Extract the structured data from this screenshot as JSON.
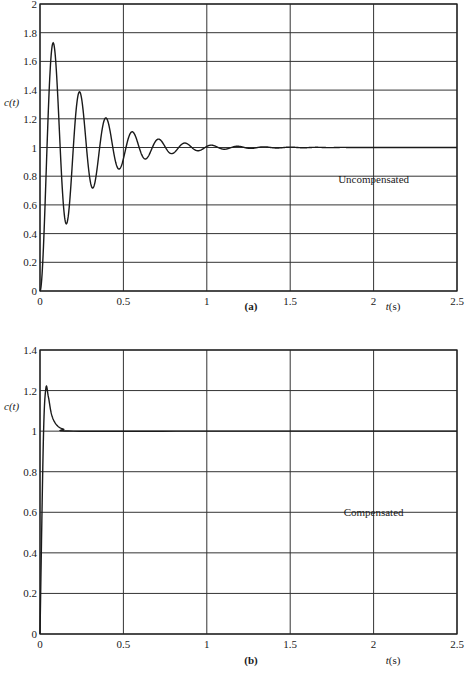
{
  "colors": {
    "line": "#1a1a1a",
    "grid": "#333333",
    "background": "#ffffff"
  },
  "chart_data": [
    {
      "type": "line",
      "panel": "(a)",
      "caption": "(a)",
      "title": "",
      "xlabel": "t(s)",
      "ylabel": "c(t)",
      "xlim": [
        0,
        2.5
      ],
      "ylim": [
        0,
        2
      ],
      "grid": true,
      "xticks": [
        "0",
        "0.5",
        "1",
        "1.5",
        "2",
        "2.5"
      ],
      "yticks": [
        "0",
        "0.2",
        "0.4",
        "0.6",
        "0.8",
        "1",
        "1.2",
        "1.4",
        "1.6",
        "1.8",
        "2"
      ],
      "annotation": {
        "text": "Uncompensated",
        "x": 2.0,
        "y": 0.75
      },
      "series": [
        {
          "name": "Uncompensated",
          "model": {
            "zeta": 0.1,
            "wn": 40,
            "final_value": 1
          },
          "key_points": [
            {
              "t": 0.0,
              "c": 0.0
            },
            {
              "t": 0.08,
              "c": 1.8
            },
            {
              "t": 0.16,
              "c": 0.34
            },
            {
              "t": 0.24,
              "c": 1.53
            },
            {
              "t": 0.32,
              "c": 0.55
            },
            {
              "t": 0.39,
              "c": 1.35
            },
            {
              "t": 0.47,
              "c": 0.69
            },
            {
              "t": 0.55,
              "c": 1.24
            },
            {
              "t": 0.63,
              "c": 0.79
            },
            {
              "t": 0.71,
              "c": 1.16
            },
            {
              "t": 0.79,
              "c": 0.86
            },
            {
              "t": 0.87,
              "c": 1.1
            },
            {
              "t": 0.95,
              "c": 0.91
            },
            {
              "t": 1.03,
              "c": 1.07
            },
            {
              "t": 1.11,
              "c": 0.95
            },
            {
              "t": 1.5,
              "c": 1.01
            },
            {
              "t": 2.0,
              "c": 1.0
            },
            {
              "t": 2.5,
              "c": 1.0
            }
          ]
        }
      ]
    },
    {
      "type": "line",
      "panel": "(b)",
      "caption": "(b)",
      "title": "",
      "xlabel": "t(s)",
      "ylabel": "c(t)",
      "xlim": [
        0,
        2.5
      ],
      "ylim": [
        0,
        1.4
      ],
      "grid": true,
      "xticks": [
        "0",
        "0.5",
        "1",
        "1.5",
        "2",
        "2.5"
      ],
      "yticks": [
        "0",
        "0.2",
        "0.4",
        "0.6",
        "0.8",
        "1",
        "1.2",
        "1.4"
      ],
      "annotation": {
        "text": "Compensated",
        "x": 2.0,
        "y": 0.58
      },
      "series": [
        {
          "name": "Compensated",
          "key_points": [
            {
              "t": 0.0,
              "c": 0.0
            },
            {
              "t": 0.02,
              "c": 0.95
            },
            {
              "t": 0.035,
              "c": 1.21
            },
            {
              "t": 0.05,
              "c": 1.17
            },
            {
              "t": 0.07,
              "c": 1.08
            },
            {
              "t": 0.1,
              "c": 1.03
            },
            {
              "t": 0.14,
              "c": 1.01
            },
            {
              "t": 0.2,
              "c": 1.0
            },
            {
              "t": 1.0,
              "c": 1.0
            },
            {
              "t": 2.5,
              "c": 1.0
            }
          ]
        }
      ]
    }
  ]
}
